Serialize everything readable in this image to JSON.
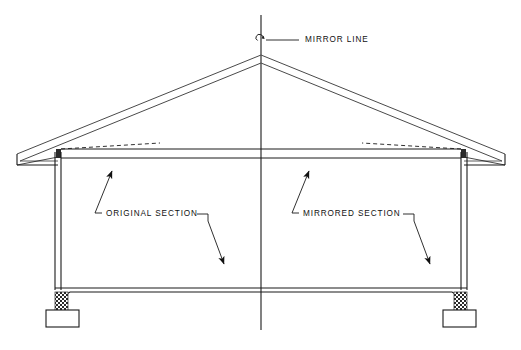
{
  "drawing": {
    "title": "Building Section Mirror Diagram",
    "background_color": "#ffffff",
    "line_color": "#1a1a1a",
    "thin_line_color": "#555555",
    "hatch_color": "#2b2b2b",
    "width": 521,
    "height": 350
  },
  "labels": {
    "mirror_line": "MIRROR  LINE",
    "original_section": "ORIGINAL  SECTION",
    "mirrored_section": "MIRRORED  SECTION"
  },
  "annotations": [
    {
      "id": "mirror-line",
      "text": "MIRROR  LINE",
      "text_x": 305,
      "text_y": 40,
      "leader_from_x": 270,
      "leader_from_y": 40,
      "leader_to_x": 299,
      "leader_to_y": 40,
      "symbol": "rotation-loop",
      "symbol_x": 261,
      "symbol_y": 40
    },
    {
      "id": "original-section",
      "text": "ORIGINAL  SECTION",
      "text_x": 112,
      "text_y": 214,
      "arrows": [
        {
          "from_x": 95,
          "from_y": 213,
          "to_x": 110,
          "to_y": 171,
          "head": "up-right"
        },
        {
          "from_x": 207,
          "from_y": 215,
          "to_x": 224,
          "to_y": 264,
          "head": "down-right"
        }
      ]
    },
    {
      "id": "mirrored-section",
      "text": "MIRRORED  SECTION",
      "text_x": 309,
      "text_y": 214,
      "arrows": [
        {
          "from_x": 292,
          "from_y": 213,
          "to_x": 307,
          "to_y": 171,
          "head": "up-right"
        },
        {
          "from_x": 413,
          "from_y": 215,
          "to_x": 430,
          "to_y": 264,
          "head": "down-right"
        }
      ]
    }
  ],
  "geometry": {
    "mirror_axis_x": 261,
    "mirror_axis_top_y": 15,
    "mirror_axis_bottom_y": 330,
    "ridge_x": 261,
    "ridge_y": 55,
    "ridge_inner_y": 63,
    "eave_left_x": 58,
    "eave_right_x": 464,
    "eave_y": 143,
    "overhang_left_x": 17,
    "overhang_right_x": 505,
    "overhang_y": 157,
    "ceiling_y": 160,
    "wall_left_x": 58,
    "wall_right_x": 464,
    "wall_top_y": 157,
    "wall_bottom_y": 288,
    "floor_top_y": 288,
    "floor_bottom_y": 296,
    "footing_left_x": 50,
    "footing_right_x": 440,
    "footing_top_y": 310,
    "footing_width": 40,
    "footing_height": 20,
    "pier_width": 14,
    "pier_top_y": 290,
    "pier_bottom_y": 312
  }
}
